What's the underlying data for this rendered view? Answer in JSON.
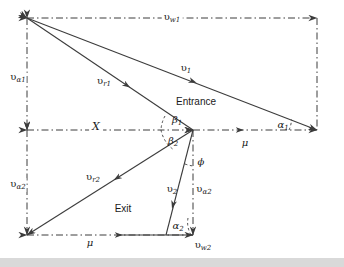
{
  "figure": {
    "kind": "velocity-triangle-diagram",
    "title_visible": false,
    "background_color": "#ffffff",
    "line_color": "#3c3c3c",
    "text_color": "#1a1a1a",
    "footer_band_color": "#d9d9d9"
  },
  "labels": {
    "entrance": "Entrance",
    "exit": "Exit",
    "x_distance": "X",
    "v_w1": {
      "base": "υ",
      "sub": "w1"
    },
    "v_w2": {
      "base": "υ",
      "sub": "w2"
    },
    "v_a1": {
      "base": "υ",
      "sub": "α1"
    },
    "v_a2_left": {
      "base": "υ",
      "sub": "α2"
    },
    "v_a2_center": {
      "base": "υ",
      "sub": "α2"
    },
    "v_1": {
      "base": "υ",
      "sub": "1"
    },
    "v_2": {
      "base": "υ",
      "sub": "2"
    },
    "v_r1": {
      "base": "υ",
      "sub": "r1"
    },
    "v_r2": {
      "base": "υ",
      "sub": "r2"
    },
    "alpha_1": {
      "base": "α",
      "sub": "1"
    },
    "alpha_2": {
      "base": "α",
      "sub": "2"
    },
    "beta_1": {
      "base": "β",
      "sub": "1"
    },
    "beta_2": {
      "base": "β",
      "sub": "2"
    },
    "phi": {
      "base": "ϕ",
      "sub": ""
    },
    "mu_top": {
      "base": "μ",
      "sub": ""
    },
    "mu_bottom": {
      "base": "μ",
      "sub": ""
    }
  },
  "geometry": {
    "vertex_top_left": [
      27,
      18
    ],
    "vertex_top_right": [
      317,
      18
    ],
    "vertex_mid_left": [
      27,
      130
    ],
    "vertex_mid_center": [
      193,
      130
    ],
    "vertex_mid_right": [
      317,
      130
    ],
    "vertex_bottom_left": [
      27,
      235
    ],
    "vertex_bottom_center": [
      193,
      235
    ]
  },
  "label_positions": {
    "v_w1": [
      172,
      18
    ],
    "v_a1": [
      18,
      78
    ],
    "v_1": [
      186,
      69
    ],
    "v_r1": [
      104,
      82
    ],
    "entrance": [
      196,
      102
    ],
    "x_distance": [
      96,
      126
    ],
    "beta_1": [
      177,
      122
    ],
    "beta_2": [
      173,
      142
    ],
    "alpha_1": [
      283,
      126
    ],
    "mu_top": [
      245,
      143
    ],
    "phi": [
      201,
      162
    ],
    "v_a2_left": [
      18,
      185
    ],
    "v_r2": [
      93,
      178
    ],
    "v_2": [
      172,
      190
    ],
    "v_a2_center": [
      202,
      190
    ],
    "exit": [
      123,
      209
    ],
    "mu_bottom": [
      90,
      243
    ],
    "alpha_2": [
      178,
      228
    ],
    "v_w2": [
      203,
      246
    ]
  }
}
